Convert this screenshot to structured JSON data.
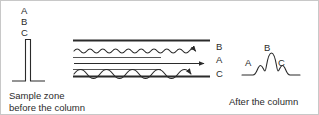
{
  "figure": {
    "background_color": "#ffffff",
    "ink_color": "#2b2b2b",
    "border_color": "#c8c8c8"
  },
  "left_panel": {
    "stack_labels": [
      "A",
      "B",
      "C"
    ],
    "caption_line1": "Sample zone",
    "caption_line2": "before the column",
    "peak_description": "single narrow unresolved peak on a flat baseline"
  },
  "column_panel": {
    "tracks": [
      {
        "label": "B",
        "path_type": "wavy-small",
        "note": "high-frequency low-amplitude wavy path with arrowhead"
      },
      {
        "label": "A",
        "path_type": "straight",
        "note": "straight path with arrowhead"
      },
      {
        "label": "C",
        "path_type": "wavy-large",
        "note": "low-frequency high-amplitude wavy path with arrowhead"
      }
    ],
    "wall_lines": 2,
    "divider_lines": 2
  },
  "right_panel": {
    "peak_labels": [
      "A",
      "B",
      "C"
    ],
    "caption": "After the column",
    "peak_description": "three overlapping resolved peaks, B tallest in the centre"
  }
}
